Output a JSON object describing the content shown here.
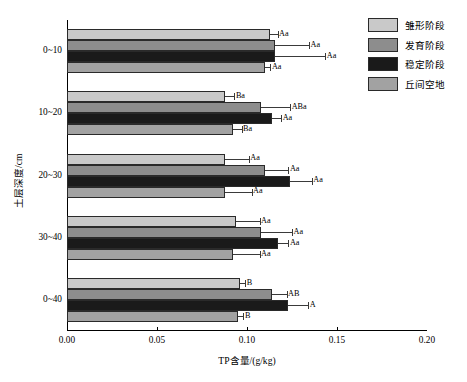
{
  "chart_data": {
    "type": "bar",
    "orientation": "horizontal",
    "title": "",
    "xlabel": "TP含量/(g/kg)",
    "ylabel": "土层深度/cm",
    "xlim": [
      0.0,
      0.2
    ],
    "xticks": [
      "0.00",
      "0.05",
      "0.10",
      "0.15",
      "0.20"
    ],
    "xtick_values": [
      0.0,
      0.05,
      0.1,
      0.15,
      0.2
    ],
    "grid": false,
    "legend_position": "top-right",
    "categories": [
      "0~10",
      "10~20",
      "20~30",
      "30~40",
      "0~40"
    ],
    "series": [
      {
        "name": "雏形阶段",
        "color": "#c9c9c9",
        "values": [
          0.113,
          0.088,
          0.088,
          0.094,
          0.096
        ],
        "errors": [
          0.004,
          0.005,
          0.013,
          0.013,
          0.003
        ],
        "labels": [
          "Aa",
          "Ba",
          "Aa",
          "Aa",
          "B"
        ]
      },
      {
        "name": "发育阶段",
        "color": "#8d8d8d",
        "values": [
          0.1155,
          0.108,
          0.11,
          0.108,
          0.114
        ],
        "errors": [
          0.019,
          0.016,
          0.013,
          0.017,
          0.008
        ],
        "labels": [
          "Aa",
          "ABa",
          "Aa",
          "Aa",
          "AB"
        ]
      },
      {
        "name": "稳定阶段",
        "color": "#1a1a1a",
        "values": [
          0.1155,
          0.114,
          0.124,
          0.117,
          0.123
        ],
        "errors": [
          0.028,
          0.005,
          0.012,
          0.006,
          0.011
        ],
        "labels": [
          "Aa",
          "Aa",
          "Aa",
          "Aa",
          "A"
        ]
      },
      {
        "name": "丘间空地",
        "color": "#a2a2a2",
        "values": [
          0.11,
          0.092,
          0.0875,
          0.092,
          0.095
        ],
        "errors": [
          0.003,
          0.005,
          0.015,
          0.015,
          0.003
        ],
        "labels": [
          "Aa",
          "Ba",
          "Aa",
          "Aa",
          "B"
        ]
      }
    ]
  },
  "legend": {
    "items": [
      {
        "label": "雏形阶段",
        "color": "#c9c9c9"
      },
      {
        "label": "发育阶段",
        "color": "#8d8d8d"
      },
      {
        "label": "稳定阶段",
        "color": "#1a1a1a"
      },
      {
        "label": "丘间空地",
        "color": "#a2a2a2"
      }
    ]
  },
  "colors": {
    "axis": "#000000",
    "bar_edge": "#2a2a2a",
    "error": "#3a3a3a",
    "background": "#ffffff"
  }
}
